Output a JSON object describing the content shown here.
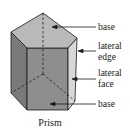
{
  "diagram": {
    "title": "Prism",
    "labels": [
      {
        "id": "base-top",
        "lines": [
          "base"
        ]
      },
      {
        "id": "lateral-edge",
        "lines": [
          "lateral",
          "edge"
        ]
      },
      {
        "id": "lateral-face",
        "lines": [
          "lateral",
          "face"
        ]
      },
      {
        "id": "base-bottom",
        "lines": [
          "base"
        ]
      }
    ],
    "colors": {
      "top_face": "#b9b9b9",
      "left_face": "#7a7a7a",
      "front_face": "#8e8e8e",
      "right_face": "#d8d8d8",
      "edge": "#1a1a1a"
    }
  }
}
